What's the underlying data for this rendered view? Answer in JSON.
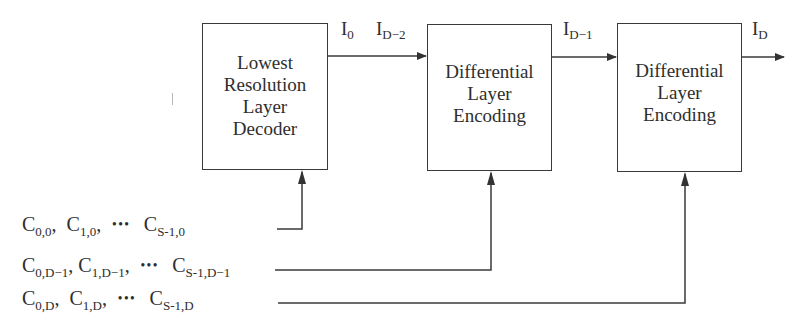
{
  "diagram": {
    "type": "block-diagram",
    "blocks": [
      {
        "id": "decoder",
        "lines": [
          "Lowest",
          "Resolution",
          "Layer",
          "Decoder"
        ]
      },
      {
        "id": "encoding1",
        "lines": [
          "Differential",
          "Layer",
          "Encoding"
        ]
      },
      {
        "id": "encoding2",
        "lines": [
          "Differential",
          "Layer",
          "Encoding"
        ]
      }
    ],
    "signals": [
      {
        "id": "i0",
        "base": "I",
        "sub": "0"
      },
      {
        "id": "id2",
        "base": "I",
        "sub": "D−2"
      },
      {
        "id": "id1",
        "base": "I",
        "sub": "D−1"
      },
      {
        "id": "id",
        "base": "I",
        "sub": "D"
      }
    ],
    "coefficient_rows": [
      {
        "terms": [
          {
            "base": "C",
            "sub": "0,0"
          },
          {
            "base": "C",
            "sub": "1,0"
          }
        ],
        "dots": "•••",
        "last": {
          "base": "C",
          "sub": "S-1,0"
        },
        "sep": ","
      },
      {
        "terms": [
          {
            "base": "C",
            "sub": "0,D−1"
          },
          {
            "base": "C",
            "sub": "1,D−1"
          }
        ],
        "dots": "•••",
        "last": {
          "base": "C",
          "sub": "S-1,D−1"
        },
        "sep": ","
      },
      {
        "terms": [
          {
            "base": "C",
            "sub": "0,D"
          },
          {
            "base": "C",
            "sub": "1,D"
          }
        ],
        "dots": "•••",
        "last": {
          "base": "C",
          "sub": "S-1,D"
        },
        "sep": ","
      }
    ],
    "colors": {
      "line": "#3a3a3a",
      "text": "#2e2e2e",
      "background": "#ffffff"
    }
  }
}
